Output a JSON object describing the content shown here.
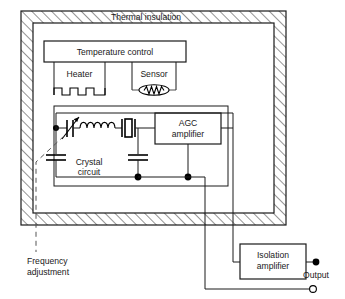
{
  "diagram": {
    "labels": {
      "thermal_insulation": "Thermal  insulation",
      "temperature_control": "Temperature  control",
      "heater": "Heater",
      "sensor": "Sensor",
      "crystal_circuit_line1": "Crystal",
      "crystal_circuit_line2": "circuit",
      "agc_line1": "AGC",
      "agc_line2": "amplifier",
      "isolation_line1": "Isolation",
      "isolation_line2": "amplifier",
      "frequency_adjustment_line1": "Frequency",
      "frequency_adjustment_line2": "adjustment",
      "output": "Output"
    },
    "components": [
      {
        "name": "thermal-insulation-enclosure",
        "kind": "hatched-band"
      },
      {
        "name": "temperature-control-block",
        "kind": "box"
      },
      {
        "name": "heater-block",
        "kind": "box-with-element"
      },
      {
        "name": "heater-element",
        "kind": "square-wave-resistor"
      },
      {
        "name": "sensor-block",
        "kind": "box-with-element"
      },
      {
        "name": "sensor-element",
        "kind": "thermistor-oval"
      },
      {
        "name": "crystal-circuit-block",
        "kind": "box"
      },
      {
        "name": "variable-capacitor",
        "kind": "variable-capacitor"
      },
      {
        "name": "inductor",
        "kind": "coil",
        "turns": 5
      },
      {
        "name": "crystal",
        "kind": "quartz-crystal"
      },
      {
        "name": "capacitor-left",
        "kind": "capacitor"
      },
      {
        "name": "capacitor-right",
        "kind": "capacitor"
      },
      {
        "name": "agc-amplifier-block",
        "kind": "box"
      },
      {
        "name": "isolation-amplifier-block",
        "kind": "box"
      },
      {
        "name": "output-terminal-positive",
        "kind": "filled-terminal"
      },
      {
        "name": "output-terminal-ground",
        "kind": "open-terminal"
      },
      {
        "name": "frequency-adjustment-callout",
        "kind": "dashed-leader"
      }
    ],
    "colors": {
      "ink": "#1a1a1a",
      "line": "#000000",
      "background": "#ffffff",
      "hatch": "#2b2b2b",
      "callout": "#555555"
    }
  }
}
